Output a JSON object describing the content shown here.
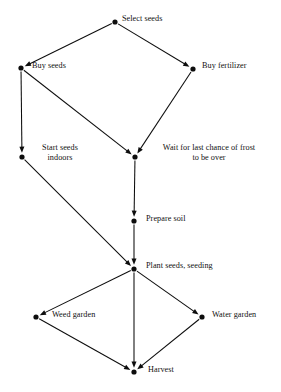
{
  "diagram": {
    "type": "directed-graph",
    "background_color": "#ffffff",
    "node_color": "#0d0d0d",
    "edge_color": "#0d0d0d",
    "text_color": "#111111",
    "canvas": {
      "width": 281,
      "height": 392
    },
    "nodes": [
      {
        "id": "select-seeds",
        "label": "Select seeds",
        "lines": [
          "Select seeds"
        ],
        "x": 115,
        "y": 22,
        "label_x": 122,
        "label_y": 14,
        "label_align": "left"
      },
      {
        "id": "buy-seeds",
        "label": "Buy seeds",
        "lines": [
          "Buy seeds"
        ],
        "x": 21,
        "y": 68,
        "label_x": 32,
        "label_y": 61,
        "label_align": "left"
      },
      {
        "id": "buy-fertilizer",
        "label": "Buy fertilizer",
        "lines": [
          "Buy fertilizer"
        ],
        "x": 193,
        "y": 69,
        "label_x": 202,
        "label_y": 61,
        "label_align": "left"
      },
      {
        "id": "start-seeds-indoors",
        "label": "Start seeds indoors",
        "lines": [
          "Start seeds",
          "indoors"
        ],
        "x": 22,
        "y": 157,
        "label_x": 29,
        "label_y": 143,
        "label_width": 62,
        "label_align": "center"
      },
      {
        "id": "wait-for-frost",
        "label": "Wait for last chance of frost to be over",
        "lines": [
          "Wait for last chance of frost",
          "to be over"
        ],
        "x": 135,
        "y": 157,
        "label_x": 144,
        "label_y": 143,
        "label_width": 130,
        "label_align": "center"
      },
      {
        "id": "prepare-soil",
        "label": "Prepare soil",
        "lines": [
          "Prepare soil"
        ],
        "x": 134,
        "y": 221,
        "label_x": 146,
        "label_y": 214,
        "label_align": "left"
      },
      {
        "id": "plant-seeds-seeding",
        "label": "Plant seeds, seeding",
        "lines": [
          "Plant seeds, seeding"
        ],
        "x": 134,
        "y": 269,
        "label_x": 146,
        "label_y": 261,
        "label_align": "left"
      },
      {
        "id": "weed-garden",
        "label": "Weed garden",
        "lines": [
          "Weed garden"
        ],
        "x": 36,
        "y": 317,
        "label_x": 52,
        "label_y": 310,
        "label_align": "left"
      },
      {
        "id": "water-garden",
        "label": "Water garden",
        "lines": [
          "Water garden"
        ],
        "x": 202,
        "y": 317,
        "label_x": 212,
        "label_y": 310,
        "label_align": "left"
      },
      {
        "id": "harvest",
        "label": "Harvest",
        "lines": [
          "Harvest"
        ],
        "x": 134,
        "y": 372,
        "label_x": 148,
        "label_y": 365,
        "label_align": "left"
      }
    ],
    "edges": [
      {
        "id": "select-seeds__buy-seeds",
        "from": "select-seeds",
        "to": "buy-seeds"
      },
      {
        "id": "select-seeds__buy-fertilizer",
        "from": "select-seeds",
        "to": "buy-fertilizer"
      },
      {
        "id": "buy-seeds__start-seeds-indoors",
        "from": "buy-seeds",
        "to": "start-seeds-indoors"
      },
      {
        "id": "buy-seeds__wait-for-frost",
        "from": "buy-seeds",
        "to": "wait-for-frost"
      },
      {
        "id": "buy-fertilizer__wait-for-frost",
        "from": "buy-fertilizer",
        "to": "wait-for-frost"
      },
      {
        "id": "start-seeds-indoors__plant-seeds",
        "from": "start-seeds-indoors",
        "to": "plant-seeds-seeding"
      },
      {
        "id": "wait-for-frost__prepare-soil",
        "from": "wait-for-frost",
        "to": "prepare-soil"
      },
      {
        "id": "prepare-soil__plant-seeds",
        "from": "prepare-soil",
        "to": "plant-seeds-seeding"
      },
      {
        "id": "plant-seeds__weed-garden",
        "from": "plant-seeds-seeding",
        "to": "weed-garden"
      },
      {
        "id": "plant-seeds__water-garden",
        "from": "plant-seeds-seeding",
        "to": "water-garden"
      },
      {
        "id": "plant-seeds__harvest",
        "from": "plant-seeds-seeding",
        "to": "harvest"
      },
      {
        "id": "weed-garden__harvest",
        "from": "weed-garden",
        "to": "harvest"
      },
      {
        "id": "water-garden__harvest",
        "from": "water-garden",
        "to": "harvest"
      }
    ]
  }
}
